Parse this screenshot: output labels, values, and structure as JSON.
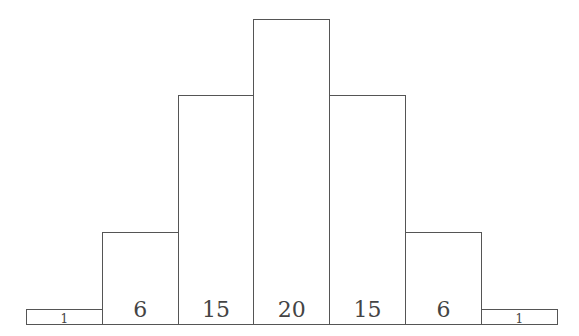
{
  "chart_data": {
    "type": "bar",
    "title": "",
    "xlabel": "",
    "ylabel": "",
    "categories": [
      "0",
      "1",
      "2",
      "3",
      "4",
      "5",
      "6"
    ],
    "values": [
      1,
      6,
      15,
      20,
      15,
      6,
      1
    ],
    "data_labels": [
      "1",
      "6",
      "15",
      "20",
      "15",
      "6",
      "1"
    ],
    "ylim": [
      0,
      20
    ],
    "grid": false,
    "legend": null,
    "bar_style": {
      "fill": "#ffffff",
      "stroke": "#555555",
      "label_color": "#444444"
    }
  }
}
